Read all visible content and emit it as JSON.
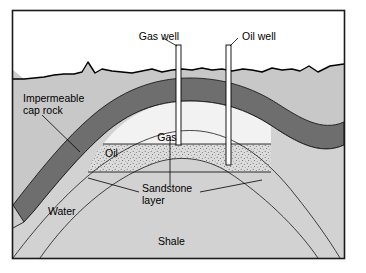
{
  "figure": {
    "name": "oil-and-gas-trap-cross-section",
    "frame": {
      "x": 12,
      "y": 10,
      "width": 333,
      "height": 249,
      "border_color": "#1a1a1a",
      "background": "#ffffff"
    }
  },
  "colors": {
    "sky": "#ffffff",
    "overburden": "#c8c8c8",
    "cap_rock": "#6e6e6e",
    "sandstone_gas": "#f2f2f2",
    "sandstone_oil": "#dcdcdc",
    "sandstone_water": "#d2d2d2",
    "shale": "#cdcdcd",
    "well_fill": "#ffffff",
    "outline": "#1a1a1a",
    "text": "#000000"
  },
  "labels": {
    "gas_well": "Gas well",
    "oil_well": "Oil well",
    "impermeable_cap_rock_line1": "Impermeable",
    "impermeable_cap_rock_line2": "cap rock",
    "gas": "Gas",
    "oil": "Oil",
    "sandstone_line1": "Sandstone",
    "sandstone_line2": "layer",
    "water": "Water",
    "shale": "Shale"
  },
  "geology": {
    "structure_type": "anticline",
    "layers": [
      {
        "name": "overburden",
        "label": "",
        "fill": "#c8c8c8"
      },
      {
        "name": "impermeable-cap-rock",
        "label": "Impermeable cap rock",
        "fill": "#6e6e6e"
      },
      {
        "name": "sandstone-layer",
        "label": "Sandstone layer",
        "fill": "#d2d2d2"
      },
      {
        "name": "shale",
        "label": "Shale",
        "fill": "#cdcdcd"
      }
    ],
    "reservoir_fluids": [
      {
        "name": "gas",
        "label": "Gas",
        "fill": "#f2f2f2",
        "position": "crest"
      },
      {
        "name": "oil",
        "label": "Oil",
        "fill": "#dcdcdc",
        "texture": "stipple",
        "position": "middle"
      },
      {
        "name": "water",
        "label": "Water",
        "fill": "#d2d2d2",
        "position": "flanks"
      }
    ],
    "wells": [
      {
        "name": "gas-well",
        "label": "Gas well",
        "target": "gas"
      },
      {
        "name": "oil-well",
        "label": "Oil well",
        "target": "oil"
      }
    ],
    "contacts": [
      {
        "name": "gas-oil-contact",
        "type": "horizontal"
      },
      {
        "name": "oil-water-contact",
        "type": "horizontal"
      }
    ]
  }
}
